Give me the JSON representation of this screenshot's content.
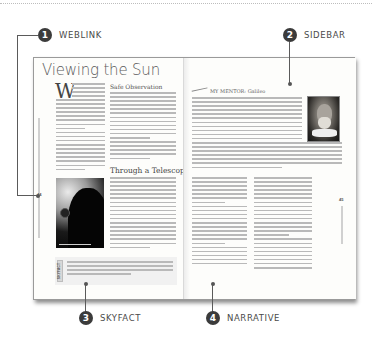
{
  "callouts": [
    {
      "number": "1",
      "label": "WEBLINK"
    },
    {
      "number": "2",
      "label": "SIDEBAR"
    },
    {
      "number": "3",
      "label": "SKYFACT"
    },
    {
      "number": "4",
      "label": "NARRATIVE"
    }
  ],
  "book": {
    "left_page": {
      "title": "Viewing the Sun",
      "dropcap": "W",
      "subheads": [
        "Safe Observation",
        "Through a Telescope"
      ],
      "photo_caption": "",
      "skyfact_tag": "SKYFACT",
      "folio": "44",
      "running_head": "Backyard Guide to the Night Sky"
    },
    "right_page": {
      "sidebar_heading": "MY MENTOR: Galileo",
      "folio": "45",
      "running_head": "Chapter 2 | The Sun"
    }
  }
}
